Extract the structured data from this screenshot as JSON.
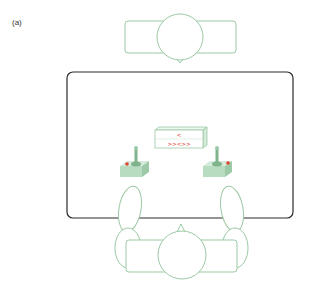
{
  "figure": {
    "panel_label": "(a)",
    "colors": {
      "figure_outline": "#9cc9a5",
      "table_outline": "#2a2a2a",
      "joystick_fill": "#b7dcc0",
      "joystick_dark": "#7fb38c",
      "button_red": "#e0452d",
      "display_text": "#e0452d"
    },
    "display": {
      "line1": "<",
      "line2": ">><>>"
    },
    "elements": {
      "top_player": "person-top",
      "bottom_player": "person-bottom",
      "table": "table",
      "left_joystick": "joystick-left",
      "right_joystick": "joystick-right",
      "display_box": "display-box"
    }
  }
}
